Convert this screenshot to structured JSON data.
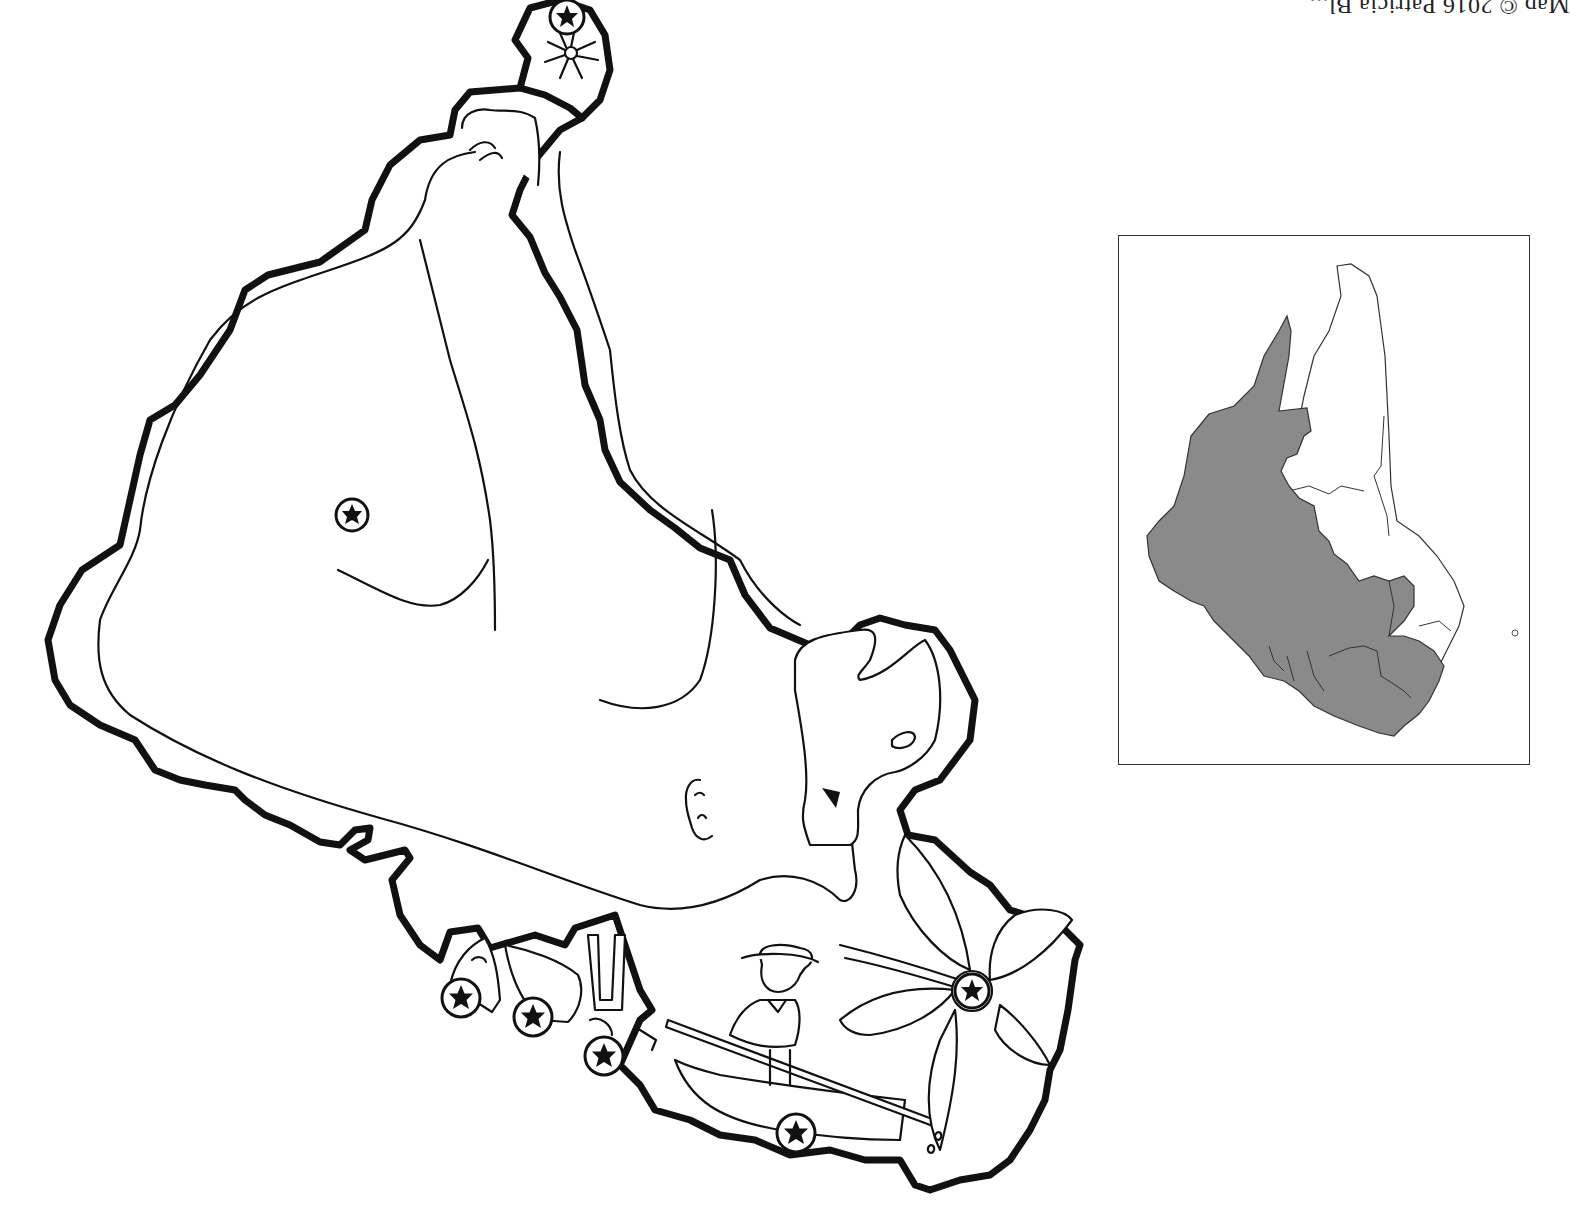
{
  "map": {
    "type": "illustrated-regional-map",
    "orientation": "rotated-180",
    "colors": {
      "background": "#ffffff",
      "ink": "#111111",
      "highlight_region": "#8a8a8a",
      "inset_border": "#333333"
    },
    "credit_text": "Map © 2016 Patricia Bl...",
    "markers": [
      {
        "id": "marker-sun-top",
        "icon": "star-in-circle-icon",
        "x": 567,
        "y": 17
      },
      {
        "id": "marker-interior",
        "icon": "star-in-circle-icon",
        "x": 352,
        "y": 515
      },
      {
        "id": "marker-bottom-1",
        "icon": "star-in-circle-icon",
        "x": 461,
        "y": 998
      },
      {
        "id": "marker-bottom-2",
        "icon": "star-in-circle-icon",
        "x": 533,
        "y": 1017
      },
      {
        "id": "marker-bottom-3",
        "icon": "star-in-circle-icon",
        "x": 604,
        "y": 1056
      },
      {
        "id": "marker-boat",
        "icon": "star-in-circle-icon",
        "x": 796,
        "y": 1133
      },
      {
        "id": "marker-flower",
        "icon": "star-in-circle-icon",
        "x": 972,
        "y": 991
      }
    ],
    "illustrations": [
      {
        "id": "sun-symbol",
        "icon": "sun-icon"
      },
      {
        "id": "fisherman-in-boat",
        "icon": "fisherman-icon"
      },
      {
        "id": "flower",
        "icon": "flower-icon"
      },
      {
        "id": "pillars",
        "icon": "monument-icon"
      },
      {
        "id": "bell",
        "icon": "bell-icon"
      }
    ]
  },
  "inset": {
    "label": "locator-map",
    "highlighted_regions": "southern and western provinces (shaded gray)",
    "unshaded_regions": "northern peninsula provinces (white)"
  }
}
